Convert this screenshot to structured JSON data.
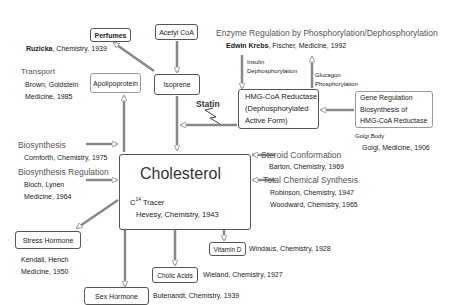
{
  "diagram": {
    "center": {
      "title": "Cholesterol",
      "tracer_prefix": "C",
      "tracer_sup": "14",
      "tracer_label": " Tracer",
      "tracer_award": "Hevesy, Chemistry, 1943"
    },
    "nodes": {
      "perfumes": "Perfumes",
      "acetyl_coa": "Acetyl CoA",
      "isoprene": "Isoprene",
      "apolipoprotein": "Apolipoprotein",
      "hmg_line1": "HMG-CoA Reductase",
      "hmg_line2": "(Dephosphorylated",
      "hmg_line3": "Active Form)",
      "gene_line1": "Gene Regulation",
      "gene_line2": "Biosynthesis of",
      "gene_line3": "HMG-CoA Reductase",
      "vitamin_d": "Vitamin  D",
      "cholic_acids": "Cholic Acids",
      "sex_hormone": "Sex Hormone",
      "stress_hormone": "Stress Hormone"
    },
    "labels": {
      "ruzicka_name": "Ruzicka",
      "ruzicka_award": ", Chemistry, 1939",
      "transport": "Transport",
      "transport_l1": "Brown, Goldstein",
      "transport_l2": "Medicine, 1985",
      "enzyme_title": "Enzyme Regulation by Phosphorylation/Dephosphorylation",
      "enzyme_name": "Edwin Krebs",
      "enzyme_award": ", Fischer, Medicine, 1992",
      "insulin_l1": "Insulin",
      "insulin_l2": "Dephosphorylation",
      "glucagon_l1": "Glucagon",
      "glucagon_l2": "Phosphorylation",
      "statin": "Statin",
      "golgi_body": "Golgi Body",
      "golgi_award": "Golgi, Medicine, 1906",
      "biosynthesis": "Biosynthesis",
      "biosynthesis_award": "Cornforth, Chemistry, 1975",
      "bio_reg": "Biosynthesis Regulation",
      "bio_reg_l1": "Bloch, Lynen",
      "bio_reg_l2": "Medicine, 1964",
      "steroid": "Steroid Conformation",
      "steroid_award": "Barton, Chemistry,  1969",
      "total_synth": "Total Chemical Synthesis",
      "total_synth_l1": "Robinson, Chemistry, 1947",
      "total_synth_l2": "Woodward, Chemistry, 1965",
      "vitamin_d_award": "Windaus, Chemistry, 1928",
      "cholic_award": "Wieland, Chemistry, 1927",
      "sex_award": "Butenandt, Chemistry, 1939",
      "stress_l1": "Kendall, Hench",
      "stress_l2": "Medicine, 1950"
    },
    "colors": {
      "box_border": "#555555",
      "heading_text": "#555555",
      "arrow_stroke": "#888888"
    }
  }
}
